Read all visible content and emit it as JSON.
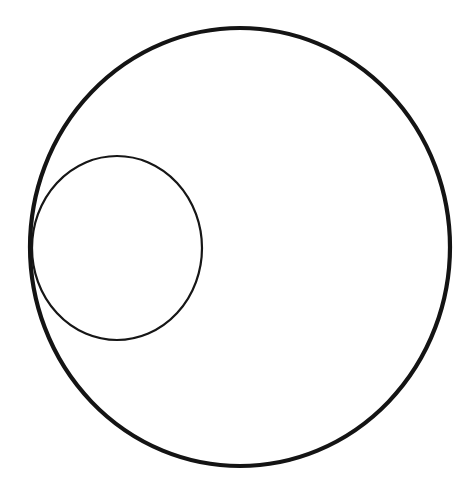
{
  "page": {
    "width": 473,
    "height": 502,
    "background_color": "#ffffff"
  },
  "figure": {
    "stroke_color": "#111111",
    "fill": "none",
    "shapes": [
      {
        "name": "large-circle",
        "type": "ellipse",
        "cx": 240,
        "cy": 247,
        "rx": 210,
        "ry": 219,
        "stroke_width": 4.2,
        "stroke_color": "#141414",
        "fill": "none",
        "bounds": {
          "left": 30,
          "right": 450,
          "top": 28,
          "bottom": 466
        }
      },
      {
        "name": "small-circle",
        "type": "ellipse",
        "cx": 117,
        "cy": 248,
        "rx": 85,
        "ry": 92,
        "stroke_width": 2.2,
        "stroke_color": "#161616",
        "fill": "none",
        "bounds": {
          "left": 32,
          "right": 202,
          "top": 156,
          "bottom": 340
        }
      }
    ],
    "baseline_rule": {
      "name": "bottom-rule",
      "type": "line",
      "x1": 0,
      "y1": 497,
      "x2": 473,
      "y2": 497,
      "stroke_width": 2,
      "gradient_from": "#f2f2f2",
      "gradient_mid": "#8d8d8d",
      "gradient_to": "#1d1d1d"
    }
  }
}
